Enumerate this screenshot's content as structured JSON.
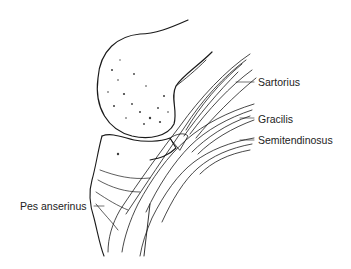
{
  "figure": {
    "labels": {
      "sartorius": "Sartorius",
      "gracilis": "Gracilis",
      "semitendinosus": "Semitendinosus",
      "pes_anserinus": "Pes anserinus"
    },
    "colors": {
      "ink": "#1a1a1a",
      "label_text": "#222222",
      "background": "#ffffff"
    }
  }
}
